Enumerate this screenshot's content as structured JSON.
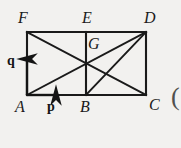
{
  "figure": {
    "background_color": "#f2f1ef",
    "line_color": "#1a1a1a",
    "vertices": [
      {
        "id": "F",
        "label": "F",
        "x": 27,
        "y": 32,
        "label_x": 18,
        "label_y": 10
      },
      {
        "id": "E",
        "label": "E",
        "x": 86,
        "y": 32,
        "label_x": 82,
        "label_y": 10
      },
      {
        "id": "D",
        "label": "D",
        "x": 146,
        "y": 32,
        "label_x": 144,
        "label_y": 10
      },
      {
        "id": "G",
        "label": "G",
        "x": 86,
        "y": 65,
        "label_x": 88,
        "label_y": 36
      },
      {
        "id": "A",
        "label": "A",
        "x": 27,
        "y": 95,
        "label_x": 15,
        "label_y": 99
      },
      {
        "id": "B",
        "label": "B",
        "x": 86,
        "y": 95,
        "label_x": 80,
        "label_y": 99
      },
      {
        "id": "C",
        "label": "C",
        "x": 146,
        "y": 95,
        "label_x": 149,
        "label_y": 97
      }
    ],
    "segments": [
      {
        "name": "edge-FD-top",
        "from": "F",
        "to": "D"
      },
      {
        "name": "edge-AC-bottom",
        "from": "A",
        "to": "C"
      },
      {
        "name": "edge-AF-left",
        "from": "A",
        "to": "F"
      },
      {
        "name": "edge-DC-right",
        "from": "D",
        "to": "C"
      },
      {
        "name": "segment-EB-mid",
        "from": "E",
        "to": "B"
      },
      {
        "name": "diagonal-FC",
        "from": "F",
        "to": "C"
      },
      {
        "name": "diagonal-AD",
        "from": "A",
        "to": "D"
      },
      {
        "name": "segment-BD",
        "from": "B",
        "to": "D"
      }
    ],
    "vectors": [
      {
        "id": "q",
        "label": "q",
        "from_x": 27,
        "from_y": 95,
        "to_x": 27,
        "to_y": 57,
        "direction": "up",
        "label_x": 7,
        "label_y": 54
      },
      {
        "id": "p",
        "label": "p",
        "from_x": 27,
        "from_y": 95,
        "to_x": 58,
        "to_y": 95,
        "direction": "right",
        "label_x": 47,
        "label_y": 100
      }
    ],
    "marks": {
      "right_paren": "("
    }
  }
}
